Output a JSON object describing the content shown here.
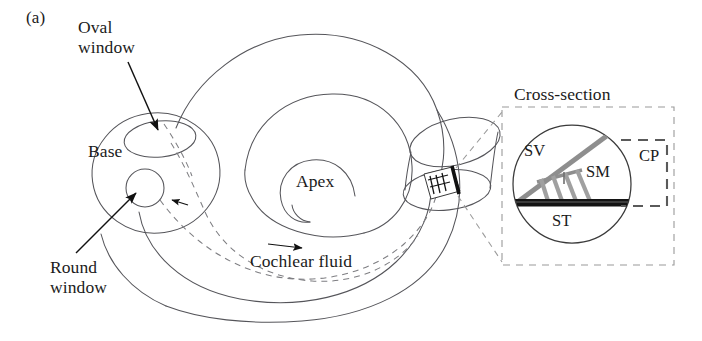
{
  "figure": {
    "panel_label": "(a)",
    "colors": {
      "outline": "#55555a",
      "ink": "#1b1b1b",
      "membrane_gray": "#9a9a9a",
      "basilar_black": "#121212",
      "inset_dash": "#9a9a9a",
      "background": "#ffffff"
    }
  },
  "labels": {
    "oval_window": "Oval\nwindow",
    "base": "Base",
    "round_window": "Round\nwindow",
    "apex": "Apex",
    "cochlear_fluid": "Cochlear fluid"
  },
  "inset": {
    "title": "Cross-section",
    "scala_vestibuli": "SV",
    "scala_media": "SM",
    "scala_tympani": "ST",
    "cochlear_partition": "CP"
  }
}
